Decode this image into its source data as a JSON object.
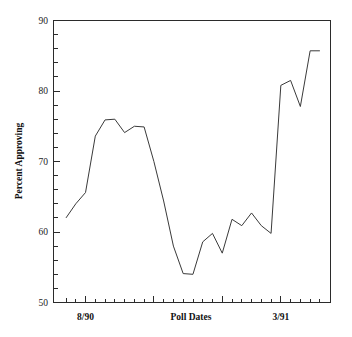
{
  "chart_data": {
    "type": "line",
    "title": "",
    "xlabel": "Poll Dates",
    "ylabel": "Percent Approving",
    "ylim": [
      50,
      90
    ],
    "y_ticks": [
      50,
      60,
      70,
      80,
      90
    ],
    "y_tick_labels": [
      "50",
      "60",
      "70",
      "80",
      "90"
    ],
    "y_minor_step": 2,
    "x_tick_labels": [
      "8/90",
      "3/91"
    ],
    "x_tick_label_positions": [
      2,
      22
    ],
    "x_major_tick_indices": [
      2,
      9,
      16,
      22
    ],
    "n_points": 27,
    "grid": false,
    "legend": null,
    "x": [
      0,
      1,
      2,
      3,
      4,
      5,
      6,
      7,
      8,
      9,
      10,
      11,
      12,
      13,
      14,
      15,
      16,
      17,
      18,
      19,
      20,
      21,
      22,
      23,
      24,
      25,
      26
    ],
    "values": [
      62.0,
      64.0,
      65.6,
      73.6,
      75.9,
      76.0,
      74.1,
      75.0,
      74.9,
      70.0,
      64.4,
      58.0,
      54.1,
      54.0,
      58.6,
      59.8,
      57.0,
      61.8,
      60.9,
      62.7,
      60.9,
      59.8,
      80.8,
      81.5,
      77.8,
      85.7,
      85.7
    ],
    "series": [
      {
        "name": "Percent Approving",
        "values": [
          62.0,
          64.0,
          65.6,
          73.6,
          75.9,
          76.0,
          74.1,
          75.0,
          74.9,
          70.0,
          64.4,
          58.0,
          54.1,
          54.0,
          58.6,
          59.8,
          57.0,
          61.8,
          60.9,
          62.7,
          60.9,
          59.8,
          80.8,
          81.5,
          77.8,
          85.7,
          85.7
        ],
        "color": "#3a3a3a"
      }
    ],
    "annotations": []
  },
  "axes": {
    "y_label": "Percent Approving",
    "x_label": "Poll Dates",
    "y_tick_0": "50",
    "y_tick_1": "60",
    "y_tick_2": "70",
    "y_tick_3": "80",
    "y_tick_4": "90",
    "x_tick_start": "8/90",
    "x_tick_end": "3/91"
  },
  "colors": {
    "line": "#3a3a3a",
    "axis": "#2b2b2b",
    "background": "#ffffff",
    "text": "#111111"
  }
}
